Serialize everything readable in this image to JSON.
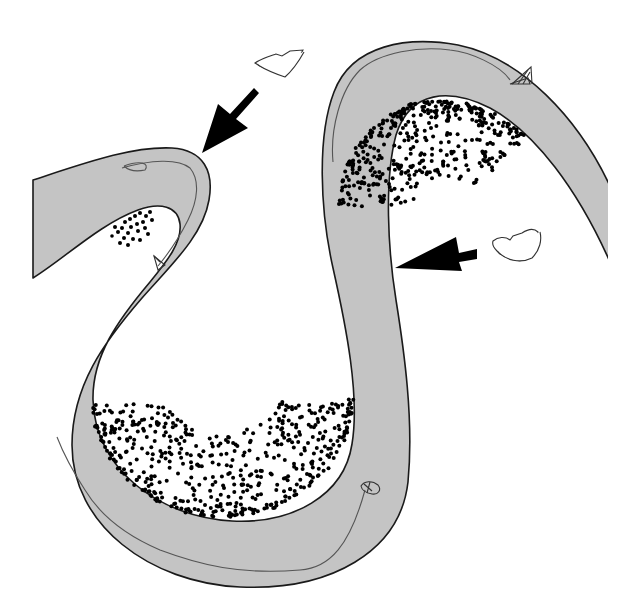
{
  "diagram": {
    "subject": "meandering river channel",
    "colors": {
      "background": "#ffffff",
      "water": "#c4c4c4",
      "bank_line": "#1a1a1a",
      "point_bar_dots": "#000000",
      "arrow": "#000000",
      "thalweg": "#555555",
      "debris_outline": "#444444"
    },
    "elements": [
      {
        "id": "channel",
        "label": "river channel"
      },
      {
        "id": "point-bar-upper-left",
        "label": "point bar deposit (inner bend)"
      },
      {
        "id": "point-bar-top-right",
        "label": "point bar deposit (inner bend)"
      },
      {
        "id": "point-bar-bottom",
        "label": "point bar deposit (inner bend)"
      },
      {
        "id": "arrow-erosion-left",
        "label": "erosion arrow at outer bank"
      },
      {
        "id": "arrow-erosion-right",
        "label": "erosion arrow at outer bank"
      },
      {
        "id": "debris-left",
        "label": "eroded bank fragment"
      },
      {
        "id": "debris-right",
        "label": "eroded bank fragment"
      },
      {
        "id": "boat-top",
        "label": "small sailboat"
      },
      {
        "id": "boat-left",
        "label": "small sailboat"
      },
      {
        "id": "boat-bottom",
        "label": "small boat"
      },
      {
        "id": "thalweg-lines",
        "label": "flow path lines along outer banks"
      }
    ]
  }
}
